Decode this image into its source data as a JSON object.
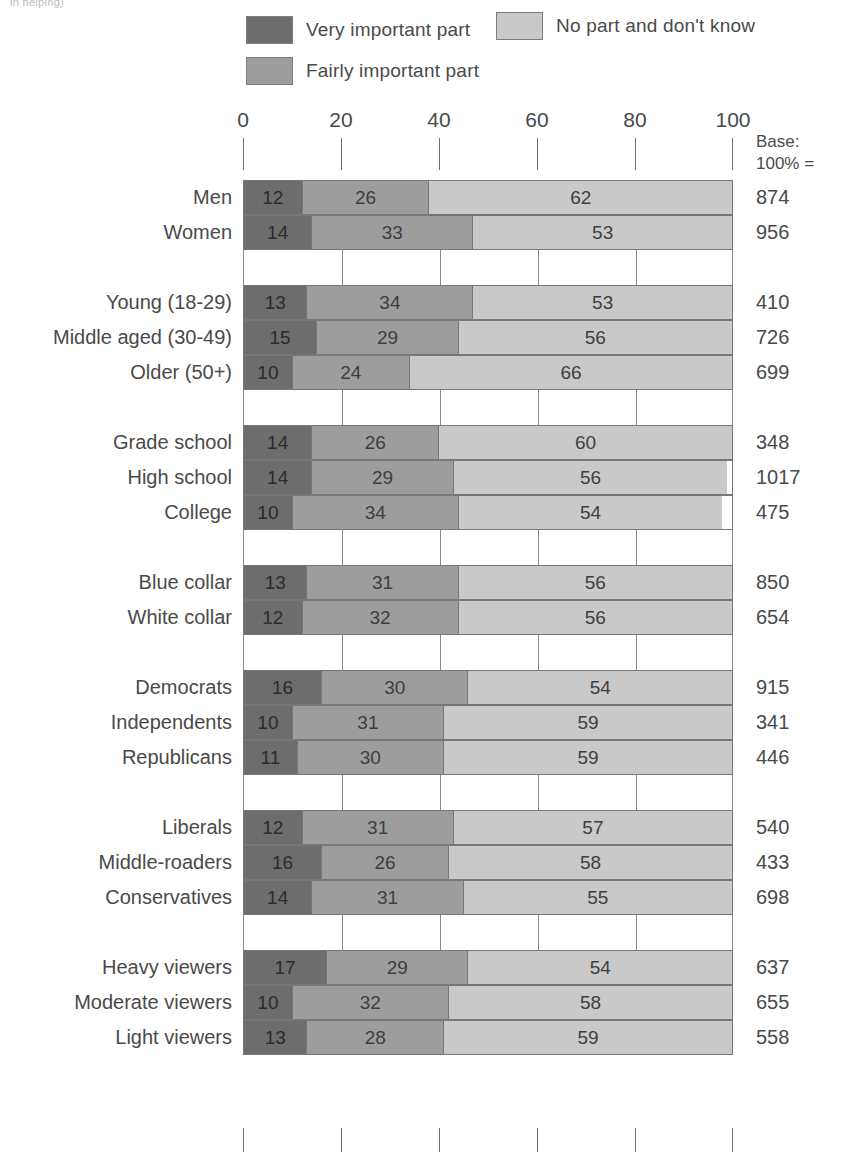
{
  "header_fragment": "in helping)",
  "legend": {
    "items": [
      {
        "label": "Very important part",
        "color": "#6d6d6d",
        "key": "very_important"
      },
      {
        "label": "Fairly important part",
        "color": "#9d9d9d",
        "key": "fairly_important"
      },
      {
        "label": "No part and don't know",
        "color": "#c9c9c9",
        "key": "no_part"
      }
    ]
  },
  "base_header": {
    "line1": "Base:",
    "line2": "100% ="
  },
  "chart_data": {
    "type": "bar",
    "title": "",
    "subtitle": "",
    "xlabel": "",
    "ylabel": "",
    "orientation": "horizontal",
    "stacked": true,
    "stacked_percent": true,
    "xlim": [
      0,
      100
    ],
    "xticks": [
      0,
      20,
      40,
      60,
      80,
      100
    ],
    "xtick_labels": [
      "0",
      "20",
      "40",
      "60",
      "80",
      "100"
    ],
    "grid": true,
    "legend_position": "top",
    "series": [
      {
        "name": "Very important part",
        "color": "#6d6d6d",
        "values": [
          12,
          14,
          13,
          15,
          10,
          14,
          14,
          10,
          13,
          12,
          16,
          10,
          11,
          12,
          16,
          14,
          17,
          10,
          13
        ]
      },
      {
        "name": "Fairly important part",
        "color": "#9d9d9d",
        "values": [
          26,
          33,
          34,
          29,
          24,
          26,
          29,
          34,
          31,
          32,
          30,
          31,
          30,
          31,
          26,
          31,
          29,
          32,
          28
        ]
      },
      {
        "name": "No part and don't know",
        "color": "#c9c9c9",
        "values": [
          62,
          53,
          53,
          56,
          66,
          60,
          56,
          54,
          56,
          56,
          54,
          59,
          59,
          57,
          58,
          55,
          54,
          58,
          59
        ]
      }
    ],
    "categories": [
      "Men",
      "Women",
      "Young (18-29)",
      "Middle aged (30-49)",
      "Older (50+)",
      "Grade school",
      "High school",
      "College",
      "Blue collar",
      "White collar",
      "Democrats",
      "Independents",
      "Republicans",
      "Liberals",
      "Middle-roaders",
      "Conservatives",
      "Heavy viewers",
      "Moderate viewers",
      "Light viewers"
    ],
    "bases": [
      874,
      956,
      410,
      726,
      699,
      348,
      1017,
      475,
      850,
      654,
      915,
      341,
      446,
      540,
      433,
      698,
      637,
      655,
      558
    ]
  },
  "rows": [
    {
      "type": "bar",
      "label": "Men",
      "values": [
        12,
        26,
        62
      ],
      "base": "874"
    },
    {
      "type": "bar",
      "label": "Women",
      "values": [
        14,
        33,
        53
      ],
      "base": "956"
    },
    {
      "type": "gap"
    },
    {
      "type": "bar",
      "label": "Young (18-29)",
      "values": [
        13,
        34,
        53
      ],
      "base": "410"
    },
    {
      "type": "bar",
      "label": "Middle aged (30-49)",
      "values": [
        15,
        29,
        56
      ],
      "base": "726"
    },
    {
      "type": "bar",
      "label": "Older (50+)",
      "values": [
        10,
        24,
        66
      ],
      "base": "699"
    },
    {
      "type": "gap"
    },
    {
      "type": "bar",
      "label": "Grade school",
      "values": [
        14,
        26,
        60
      ],
      "base": "348"
    },
    {
      "type": "bar",
      "label": "High school",
      "values": [
        14,
        29,
        56
      ],
      "base": "1017"
    },
    {
      "type": "bar",
      "label": "College",
      "values": [
        10,
        34,
        54
      ],
      "base": "475"
    },
    {
      "type": "gap"
    },
    {
      "type": "bar",
      "label": "Blue collar",
      "values": [
        13,
        31,
        56
      ],
      "base": "850"
    },
    {
      "type": "bar",
      "label": "White collar",
      "values": [
        12,
        32,
        56
      ],
      "base": "654"
    },
    {
      "type": "gap"
    },
    {
      "type": "bar",
      "label": "Democrats",
      "values": [
        16,
        30,
        54
      ],
      "base": "915"
    },
    {
      "type": "bar",
      "label": "Independents",
      "values": [
        10,
        31,
        59
      ],
      "base": "341"
    },
    {
      "type": "bar",
      "label": "Republicans",
      "values": [
        11,
        30,
        59
      ],
      "base": "446"
    },
    {
      "type": "gap"
    },
    {
      "type": "bar",
      "label": "Liberals",
      "values": [
        12,
        31,
        57
      ],
      "base": "540"
    },
    {
      "type": "bar",
      "label": "Middle-roaders",
      "values": [
        16,
        26,
        58
      ],
      "base": "433"
    },
    {
      "type": "bar",
      "label": "Conservatives",
      "values": [
        14,
        31,
        55
      ],
      "base": "698"
    },
    {
      "type": "gap"
    },
    {
      "type": "bar",
      "label": "Heavy viewers",
      "values": [
        17,
        29,
        54
      ],
      "base": "637"
    },
    {
      "type": "bar",
      "label": "Moderate viewers",
      "values": [
        10,
        32,
        58
      ],
      "base": "655"
    },
    {
      "type": "bar",
      "label": "Light viewers",
      "values": [
        13,
        28,
        59
      ],
      "base": "558"
    }
  ]
}
